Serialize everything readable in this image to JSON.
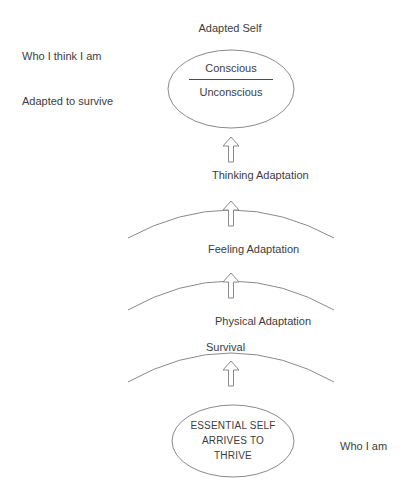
{
  "diagram": {
    "title_label": "Adapted Self",
    "colors": {
      "stroke": "#8a8a8a",
      "text": "#3c3c3c",
      "divider": "#4a4a4a",
      "background": "#ffffff"
    },
    "top_ellipse": {
      "name": "adapted-self-ellipse",
      "conscious_label": "Conscious",
      "unconscious_label": "Unconscious"
    },
    "bottom_ellipse": {
      "name": "essential-self-ellipse",
      "line1": "ESSENTIAL SELF",
      "line2": "ARRIVES TO",
      "line3": "THRIVE"
    },
    "side_labels": {
      "upper_left": "Who I think I am",
      "lower_left": "Adapted to survive",
      "bottom_right": "Who I am"
    },
    "layers": [
      {
        "label": "Thinking Adaptation"
      },
      {
        "label": "Feeling Adaptation"
      },
      {
        "label": "Physical Adaptation"
      },
      {
        "label": "Survival"
      }
    ],
    "arrows": [
      {
        "name": "arrow-to-adapted-self",
        "direction": "up"
      },
      {
        "name": "arrow-thinking",
        "direction": "up"
      },
      {
        "name": "arrow-feeling",
        "direction": "up"
      },
      {
        "name": "arrow-physical",
        "direction": "up"
      }
    ]
  }
}
